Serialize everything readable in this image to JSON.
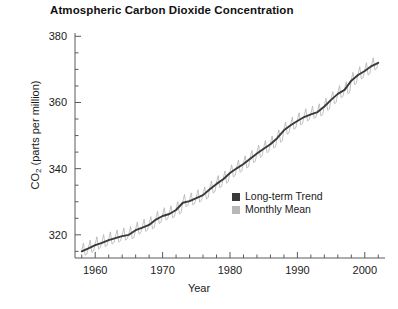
{
  "chart_data": {
    "type": "line",
    "title": "Atmospheric Carbon Dioxide Concentration",
    "xlabel": "Year",
    "ylabel": "CO2 (parts per million)",
    "ylabel_main": "CO",
    "ylabel_sub": "2",
    "ylabel_rest": " (parts per million)",
    "xlim": [
      1957.0,
      2003.0
    ],
    "ylim": [
      313.0,
      381.0
    ],
    "grid": false,
    "legend_position": "inside-lower-right",
    "x_ticks_major": [
      1960,
      1970,
      1980,
      1990,
      2000
    ],
    "x_tick_labels": [
      "1960",
      "1970",
      "1980",
      "1990",
      "2000"
    ],
    "x_tick_minor_step": 2,
    "y_ticks_major": [
      320,
      340,
      360,
      380
    ],
    "y_tick_labels": [
      "320",
      "340",
      "360",
      "380"
    ],
    "y_tick_minor_step": 5,
    "colors": {
      "trend": "#3a3a3a",
      "monthly": "#b8b8b8",
      "axis": "#5a5a5a",
      "text": "#1a1a1a",
      "background": "#ffffff"
    },
    "series": [
      {
        "name": "Long-term Trend",
        "legend_label": "Long-term Trend",
        "color": "#3a3a3a",
        "swatch": "dark-square",
        "x": [
          1958.0,
          1959.0,
          1960.0,
          1961.0,
          1962.0,
          1963.0,
          1964.0,
          1965.0,
          1966.0,
          1967.0,
          1968.0,
          1969.0,
          1970.0,
          1971.0,
          1972.0,
          1973.0,
          1974.0,
          1975.0,
          1976.0,
          1977.0,
          1978.0,
          1979.0,
          1980.0,
          1981.0,
          1982.0,
          1983.0,
          1984.0,
          1985.0,
          1986.0,
          1987.0,
          1988.0,
          1989.0,
          1990.0,
          1991.0,
          1992.0,
          1993.0,
          1994.0,
          1995.0,
          1996.0,
          1997.0,
          1998.0,
          1999.0,
          2000.0,
          2001.0,
          2002.0
        ],
        "values": [
          315.0,
          315.9,
          316.9,
          317.6,
          318.4,
          319.0,
          319.6,
          320.0,
          321.4,
          322.2,
          323.0,
          324.6,
          325.7,
          326.3,
          327.5,
          329.7,
          330.2,
          331.1,
          332.0,
          333.8,
          335.4,
          336.8,
          338.7,
          340.1,
          341.4,
          343.0,
          344.6,
          346.0,
          347.4,
          349.2,
          351.6,
          353.1,
          354.4,
          355.6,
          356.4,
          357.1,
          358.8,
          360.8,
          362.6,
          363.8,
          366.6,
          368.3,
          369.5,
          371.0,
          372.0
        ]
      },
      {
        "name": "Monthly Mean",
        "legend_label": "Monthly Mean",
        "color": "#b8b8b8",
        "swatch": "light-square",
        "seasonal_amplitude_ppm": 3.2,
        "description": "Monthly mean values oscillate seasonally around the long-term trend, peaking in May and reaching minimum in September/October.",
        "x": [
          1958.0,
          1958.25,
          1958.5,
          1958.75,
          1959.0,
          1959.25,
          1959.5,
          1959.75,
          1960.0,
          1960.25,
          1960.5,
          1960.75,
          1961.0,
          1961.25,
          1961.5,
          1961.75,
          1962.0,
          1962.25,
          1962.5,
          1962.75,
          1963.0,
          1963.25,
          1963.5,
          1963.75,
          1964.0,
          1964.25,
          1964.5,
          1964.75,
          1965.0,
          1965.25,
          1965.5,
          1965.75,
          1966.0,
          1966.25,
          1966.5,
          1966.75,
          1967.0,
          1967.25,
          1967.5,
          1967.75,
          1968.0,
          1968.25,
          1968.5,
          1968.75,
          1969.0,
          1969.25,
          1969.5,
          1969.75,
          1970.0,
          1970.25,
          1970.5,
          1970.75,
          1971.0,
          1971.25,
          1971.5,
          1971.75,
          1972.0,
          1972.25,
          1972.5,
          1972.75,
          1973.0,
          1973.25,
          1973.5,
          1973.75,
          1974.0,
          1974.25,
          1974.5,
          1974.75,
          1975.0,
          1975.25,
          1975.5,
          1975.75,
          1976.0,
          1976.25,
          1976.5,
          1976.75,
          1977.0,
          1977.25,
          1977.5,
          1977.75,
          1978.0,
          1978.25,
          1978.5,
          1978.75,
          1979.0,
          1979.25,
          1979.5,
          1979.75,
          1980.0,
          1980.25,
          1980.5,
          1980.75,
          1981.0,
          1981.25,
          1981.5,
          1981.75,
          1982.0,
          1982.25,
          1982.5,
          1982.75,
          1983.0,
          1983.25,
          1983.5,
          1983.75,
          1984.0,
          1984.25,
          1984.5,
          1984.75,
          1985.0,
          1985.25,
          1985.5,
          1985.75,
          1986.0,
          1986.25,
          1986.5,
          1986.75,
          1987.0,
          1987.25,
          1987.5,
          1987.75,
          1988.0,
          1988.25,
          1988.5,
          1988.75,
          1989.0,
          1989.25,
          1989.5,
          1989.75,
          1990.0,
          1990.25,
          1990.5,
          1990.75,
          1991.0,
          1991.25,
          1991.5,
          1991.75,
          1992.0,
          1992.25,
          1992.5,
          1992.75,
          1993.0,
          1993.25,
          1993.5,
          1993.75,
          1994.0,
          1994.25,
          1994.5,
          1994.75,
          1995.0,
          1995.25,
          1995.5,
          1995.75,
          1996.0,
          1996.25,
          1996.5,
          1996.75,
          1997.0,
          1997.25,
          1997.5,
          1997.75,
          1998.0,
          1998.25,
          1998.5,
          1998.75,
          1999.0,
          1999.25,
          1999.5,
          1999.75,
          2000.0,
          2000.25,
          2000.5,
          2000.75,
          2001.0,
          2001.25,
          2001.5,
          2001.75,
          2002.0
        ],
        "values": [
          315.3,
          317.5,
          313.8,
          314.2,
          316.2,
          318.4,
          314.7,
          315.1,
          317.2,
          319.4,
          315.7,
          316.1,
          317.9,
          320.1,
          316.4,
          316.8,
          318.7,
          320.9,
          317.2,
          317.6,
          319.3,
          321.5,
          317.8,
          318.2,
          319.9,
          322.1,
          318.4,
          318.8,
          320.3,
          322.5,
          318.8,
          319.2,
          321.7,
          323.9,
          320.2,
          320.6,
          322.5,
          324.7,
          321.0,
          321.4,
          323.3,
          325.5,
          321.8,
          322.2,
          324.9,
          327.1,
          323.4,
          323.8,
          326.0,
          328.2,
          324.5,
          324.9,
          326.6,
          328.8,
          325.1,
          325.5,
          327.8,
          330.0,
          326.3,
          326.7,
          330.0,
          332.2,
          328.5,
          328.9,
          330.5,
          332.7,
          329.0,
          329.4,
          331.4,
          333.6,
          329.9,
          330.3,
          332.3,
          334.5,
          330.8,
          331.2,
          334.1,
          336.3,
          332.6,
          333.0,
          335.7,
          337.9,
          334.2,
          334.6,
          337.1,
          339.3,
          335.6,
          336.0,
          339.0,
          341.2,
          337.5,
          337.9,
          340.4,
          342.6,
          338.9,
          339.3,
          341.7,
          343.9,
          340.2,
          340.6,
          343.3,
          345.5,
          341.8,
          342.2,
          344.9,
          347.1,
          343.4,
          343.8,
          346.3,
          348.5,
          344.8,
          345.2,
          347.7,
          349.9,
          346.2,
          346.6,
          349.5,
          351.7,
          348.0,
          348.4,
          351.9,
          354.1,
          350.4,
          350.8,
          353.4,
          355.6,
          351.9,
          352.3,
          354.7,
          356.9,
          353.2,
          353.6,
          355.9,
          358.1,
          354.4,
          354.8,
          356.7,
          358.9,
          355.2,
          355.6,
          357.4,
          359.6,
          355.9,
          356.3,
          359.1,
          361.3,
          357.6,
          358.0,
          361.1,
          363.3,
          359.6,
          360.0,
          362.9,
          365.1,
          361.4,
          361.8,
          364.1,
          366.3,
          362.6,
          363.0,
          366.9,
          369.1,
          365.4,
          365.8,
          368.6,
          370.8,
          367.1,
          367.5,
          369.8,
          372.0,
          368.3,
          368.7,
          371.3,
          373.5,
          369.8,
          370.2,
          372.3
        ]
      }
    ]
  }
}
